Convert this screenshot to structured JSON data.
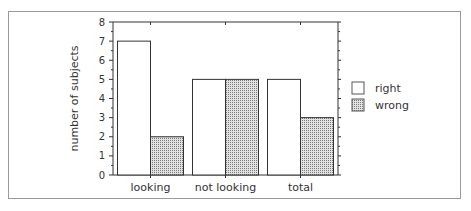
{
  "chart_data": {
    "type": "bar",
    "title": "",
    "xlabel": "",
    "ylabel": "number of subjects",
    "ylim": [
      0,
      8
    ],
    "yticks": [
      0,
      1,
      2,
      3,
      4,
      5,
      6,
      7,
      8
    ],
    "categories": [
      "looking",
      "not looking",
      "total"
    ],
    "series": [
      {
        "name": "right",
        "values": [
          7,
          5,
          5
        ],
        "fill": "#ffffff"
      },
      {
        "name": "wrong",
        "values": [
          2,
          5,
          3
        ],
        "fill": "dotted-gray"
      }
    ],
    "grid": false,
    "legend_position": "right"
  },
  "colors": {
    "axis": "#333333",
    "frame": "#9a9a9a",
    "bar_outline": "#333333",
    "wrong_fill": "#c8c8c8"
  }
}
